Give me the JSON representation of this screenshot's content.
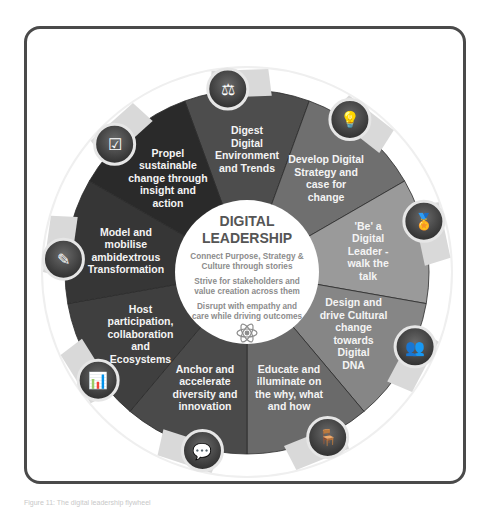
{
  "diagram": {
    "title_line1": "DIGITAL",
    "title_line2": "LEADERSHIP",
    "center_statements": [
      {
        "line1": "Connect Purpose, Strategy &",
        "line2": "Culture through stories"
      },
      {
        "line1": "Strive for stakeholders and",
        "line2": "value creation across them"
      },
      {
        "line1": "Disrupt with empathy and",
        "line2": "care while driving outcomes"
      }
    ],
    "center_icon": "atom-icon",
    "segments": [
      {
        "lines": [
          "Digest",
          "Digital",
          "Environment",
          "and Trends"
        ],
        "icon": "scales-icon",
        "color": "#4d4d4d"
      },
      {
        "lines": [
          "Develop Digital",
          "Strategy and",
          "case for",
          "change"
        ],
        "icon": "head-lightbulb-icon",
        "color": "#6f6f6f"
      },
      {
        "lines": [
          "'Be' a",
          "Digital",
          "Leader -",
          "walk the",
          "talk"
        ],
        "icon": "medal-icon",
        "color": "#9a9a9a"
      },
      {
        "lines": [
          "Design and",
          "drive Cultural",
          "change",
          "towards",
          "Digital",
          "DNA"
        ],
        "icon": "two-heads-icon",
        "color": "#868686"
      },
      {
        "lines": [
          "Educate and",
          "illuminate on",
          "the why, what",
          "and how"
        ],
        "icon": "person-at-desk-icon",
        "color": "#6a6a6a"
      },
      {
        "lines": [
          "Anchor and",
          "accelerate",
          "diversity and",
          "innovation"
        ],
        "icon": "people-chat-icon",
        "color": "#4a4a4a"
      },
      {
        "lines": [
          "Host",
          "participation,",
          "collaboration",
          "and",
          "Ecosystems"
        ],
        "icon": "presentation-icon",
        "color": "#3f3f3f"
      },
      {
        "lines": [
          "Model and",
          "mobilise",
          "ambidextrous",
          "Transformation"
        ],
        "icon": "document-edit-icon",
        "color": "#363636"
      },
      {
        "lines": [
          "Propel",
          "sustainable",
          "change through",
          "insight and",
          "action"
        ],
        "icon": "clipboard-checklist-icon",
        "color": "#2a2a2a"
      }
    ]
  },
  "caption": "Figure 11: The digital leadership flywheel"
}
